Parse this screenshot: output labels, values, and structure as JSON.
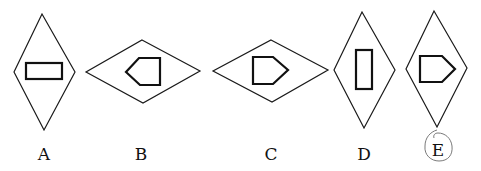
{
  "figure": {
    "type": "multiple-choice shape options",
    "options": [
      {
        "label": "A",
        "outer_shape": "vertical rhombus",
        "inner_shape": "horizontal rectangle"
      },
      {
        "label": "B",
        "outer_shape": "horizontal rhombus",
        "inner_shape": "pentagon pointing left"
      },
      {
        "label": "C",
        "outer_shape": "horizontal rhombus",
        "inner_shape": "pentagon pointing right"
      },
      {
        "label": "D",
        "outer_shape": "vertical rhombus",
        "inner_shape": "vertical rectangle"
      },
      {
        "label": "E",
        "outer_shape": "vertical rhombus",
        "inner_shape": "pentagon pointing right",
        "circled": true
      }
    ],
    "colors": {
      "stroke": "#1a1a1a",
      "background": "#ffffff",
      "pen_mark": "#7a7a7a"
    }
  }
}
